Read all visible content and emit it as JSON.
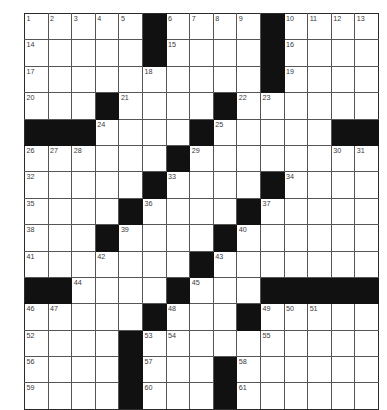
{
  "puzzle": {
    "title": "Crossword Grid",
    "type": "crossword",
    "columns": 15,
    "rows": 13,
    "colors": {
      "block": "#111111",
      "cell": "#ffffff",
      "grid_line": "#555555",
      "border": "#2b2b2b",
      "number_text": "#3a3a3a"
    },
    "numbers_visible": [
      1,
      2,
      3,
      4,
      5,
      6,
      7,
      8,
      9,
      10,
      11,
      12,
      13,
      14,
      15,
      16,
      17,
      18,
      19,
      20,
      21,
      22,
      23,
      24,
      25,
      26,
      27,
      28,
      29,
      30,
      31,
      32,
      33,
      34,
      35,
      36,
      37,
      38,
      39,
      40,
      41,
      42,
      43,
      44,
      45,
      46,
      47,
      48,
      49,
      50,
      51,
      52,
      53,
      54,
      55,
      56,
      57,
      58,
      59,
      60,
      61
    ],
    "grid": [
      [
        {
          "n": "1"
        },
        {
          "n": "2"
        },
        {
          "n": "3"
        },
        {
          "n": "4"
        },
        {
          "n": "5"
        },
        {
          "b": true
        },
        {
          "n": "6"
        },
        {
          "n": "7"
        },
        {
          "n": "8"
        },
        {
          "n": "9"
        },
        {
          "b": true
        },
        {
          "n": "10"
        },
        {
          "n": "11"
        },
        {
          "n": "12"
        },
        {
          "n": "13"
        }
      ],
      [
        {
          "n": "14"
        },
        {},
        {},
        {},
        {},
        {
          "b": true
        },
        {
          "n": "15"
        },
        {},
        {},
        {},
        {
          "b": true
        },
        {
          "n": "16"
        },
        {},
        {},
        {}
      ],
      [
        {
          "n": "17"
        },
        {},
        {},
        {},
        {},
        {
          "n": "18"
        },
        {},
        {},
        {},
        {},
        {
          "b": true
        },
        {
          "n": "19"
        },
        {},
        {},
        {}
      ],
      [
        {
          "n": "20"
        },
        {},
        {},
        {
          "b": true
        },
        {
          "n": "21"
        },
        {},
        {},
        {},
        {
          "b": true
        },
        {
          "n": "22"
        },
        {
          "n": "23"
        },
        {},
        {},
        {},
        {}
      ],
      [
        {
          "b": true
        },
        {
          "b": true
        },
        {
          "b": true
        },
        {
          "n": "24"
        },
        {},
        {},
        {},
        {
          "b": true
        },
        {
          "n": "25"
        },
        {},
        {},
        {},
        {},
        {
          "b": true
        },
        {
          "b": true
        }
      ],
      [
        {
          "n": "26"
        },
        {
          "n": "27"
        },
        {
          "n": "28"
        },
        {},
        {},
        {},
        {
          "b": true
        },
        {
          "n": "29"
        },
        {},
        {},
        {},
        {},
        {},
        {
          "n": "30"
        },
        {
          "n": "31"
        }
      ],
      [
        {
          "n": "32"
        },
        {},
        {},
        {},
        {},
        {
          "b": true
        },
        {
          "n": "33"
        },
        {},
        {},
        {},
        {
          "b": true
        },
        {
          "n": "34"
        },
        {},
        {},
        {}
      ],
      [
        {
          "n": "35"
        },
        {},
        {},
        {},
        {
          "b": true
        },
        {
          "n": "36"
        },
        {},
        {},
        {},
        {
          "b": true
        },
        {
          "n": "37"
        },
        {},
        {},
        {},
        {}
      ],
      [
        {
          "n": "38"
        },
        {},
        {},
        {
          "b": true
        },
        {
          "n": "39"
        },
        {},
        {},
        {},
        {
          "b": true
        },
        {
          "n": "40"
        },
        {},
        {},
        {},
        {},
        {}
      ],
      [
        {
          "n": "41"
        },
        {},
        {},
        {
          "n": "42"
        },
        {},
        {},
        {},
        {
          "b": true
        },
        {
          "n": "43"
        },
        {},
        {},
        {},
        {},
        {},
        {}
      ],
      [
        {
          "b": true
        },
        {
          "b": true
        },
        {
          "n": "44"
        },
        {},
        {},
        {},
        {
          "b": true
        },
        {
          "n": "45"
        },
        {},
        {},
        {
          "b": true
        },
        {
          "b": true
        },
        {
          "b": true
        },
        {
          "b": true
        },
        {
          "b": true
        }
      ],
      [
        {
          "n": "46"
        },
        {
          "n": "47"
        },
        {},
        {},
        {},
        {
          "b": true
        },
        {
          "n": "48"
        },
        {},
        {},
        {
          "b": true
        },
        {
          "n": "49"
        },
        {
          "n": "50"
        },
        {
          "n": "51"
        },
        {},
        {}
      ],
      [
        {
          "n": "52"
        },
        {},
        {},
        {},
        {
          "b": true
        },
        {
          "n": "53"
        },
        {
          "n": "54"
        },
        {},
        {},
        {},
        {
          "n": "55"
        },
        {},
        {},
        {},
        {}
      ],
      [
        {
          "n": "56"
        },
        {},
        {},
        {},
        {
          "b": true
        },
        {
          "n": "57"
        },
        {},
        {},
        {
          "b": true
        },
        {
          "n": "58"
        },
        {},
        {},
        {},
        {},
        {}
      ],
      [
        {
          "n": "59"
        },
        {},
        {},
        {},
        {
          "b": true
        },
        {
          "n": "60"
        },
        {},
        {},
        {
          "b": true
        },
        {
          "n": "61"
        },
        {},
        {},
        {},
        {},
        {}
      ]
    ]
  }
}
